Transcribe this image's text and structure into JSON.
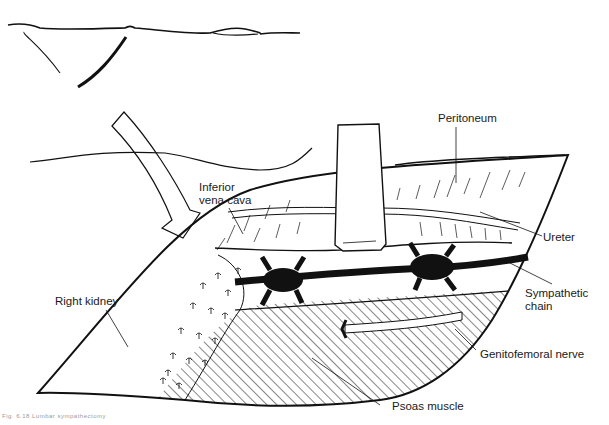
{
  "figure": {
    "type": "anatomical line drawing",
    "colors": {
      "ink": "#111111",
      "background": "#ffffff",
      "caption": "#9a9a9a"
    }
  },
  "labels": {
    "peritoneum": "Peritoneum",
    "inferior_vena_cava_line1": "Inferior",
    "inferior_vena_cava_line2": "vena cava",
    "ureter": "Ureter",
    "sympathetic_chain_line1": "Sympathetic",
    "sympathetic_chain_line2": "chain",
    "right_kidney": "Right kidney",
    "genitofemoral_nerve": "Genitofemoral nerve",
    "psoas_muscle": "Psoas muscle"
  },
  "caption": {
    "text": "Fig. 6.18 Lumbar sympathectomy"
  }
}
